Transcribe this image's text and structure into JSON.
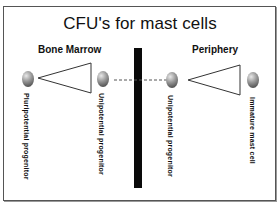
{
  "title": "CFU's for mast cells",
  "sections": {
    "left": "Bone Marrow",
    "right": "Periphery"
  },
  "cells": [
    {
      "label": "Pluripotential progenitor",
      "location": "Bone Marrow"
    },
    {
      "label": "Unipotential progenitor",
      "location": "Bone Marrow"
    },
    {
      "label": "Unipotential progenitor",
      "location": "Periphery"
    },
    {
      "label": "Immature mast cell",
      "location": "Periphery"
    }
  ],
  "arrows": [
    {
      "from": "Unipotential progenitor (Bone Marrow)",
      "to": "Unipotential progenitor (Periphery)",
      "style": "dashed"
    }
  ],
  "colors": {
    "barrier": "#0a0a0a",
    "cell_dark": "#333333",
    "cell_light": "#e8e8e8"
  }
}
